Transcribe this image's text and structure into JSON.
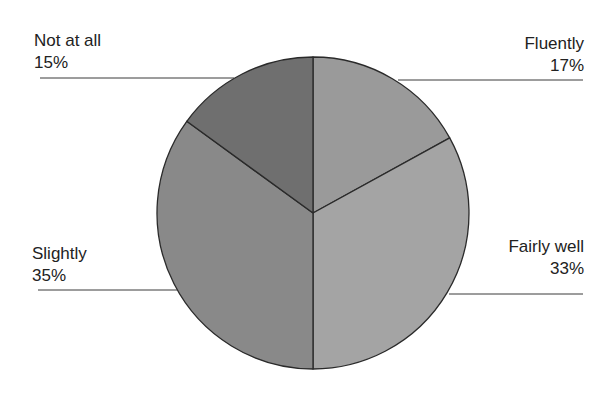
{
  "chart_data": {
    "type": "pie",
    "title": "",
    "start_angle_deg": 0,
    "direction": "clockwise",
    "slices": [
      {
        "label": "Fluently",
        "value": 17,
        "display": "17%",
        "color": "#9a9a9a"
      },
      {
        "label": "Fairly well",
        "value": 33,
        "display": "33%",
        "color": "#a4a4a4"
      },
      {
        "label": "Slightly",
        "value": 35,
        "display": "35%",
        "color": "#898989"
      },
      {
        "label": "Not at all",
        "value": 15,
        "display": "15%",
        "color": "#6f6f6f"
      }
    ],
    "legend": "none",
    "labels_position": "outside-with-leader-lines"
  },
  "labels": {
    "fluently": {
      "name": "Fluently",
      "pct": "17%"
    },
    "fairly_well": {
      "name": "Fairly well",
      "pct": "33%"
    },
    "slightly": {
      "name": "Slightly",
      "pct": "35%"
    },
    "not_at_all": {
      "name": "Not at all",
      "pct": "15%"
    }
  },
  "style": {
    "outline_color": "#2a2a2a",
    "leader_color": "#3a3a3a"
  }
}
